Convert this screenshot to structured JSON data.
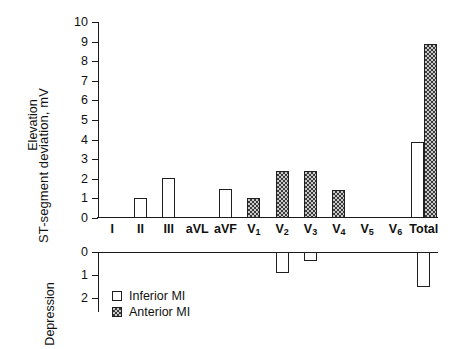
{
  "chart_data": {
    "type": "bar",
    "title": "",
    "subtitle": "",
    "ylabel": "ST-segment deviation, mV",
    "xlabel": "",
    "grid": false,
    "legend_position": "bottom-left",
    "categories": [
      "I",
      "II",
      "III",
      "aVL",
      "aVF",
      "V1",
      "V2",
      "V3",
      "V4",
      "V5",
      "V6",
      "Total"
    ],
    "category_labels": [
      "I",
      "II",
      "III",
      "aVL",
      "aVF",
      "V",
      "V",
      "V",
      "V",
      "V",
      "V",
      "Total"
    ],
    "category_subscripts": [
      "",
      "",
      "",
      "",
      "",
      "1",
      "2",
      "3",
      "4",
      "5",
      "6",
      ""
    ],
    "panels": [
      {
        "name": "elevation",
        "label": "Elevation",
        "ylim": [
          0,
          10
        ],
        "yticks": [
          0,
          1,
          2,
          3,
          4,
          5,
          6,
          7,
          8,
          9,
          10
        ],
        "ytick_labels": [
          "0",
          "1",
          "2",
          "3",
          "4",
          "5",
          "6",
          "7",
          "8",
          "9",
          "10"
        ],
        "series": [
          {
            "name": "Inferior MI",
            "fill": "white",
            "values": [
              0,
              1.0,
              2.05,
              0,
              1.5,
              0,
              0,
              0,
              0,
              0,
              0,
              3.9
            ]
          },
          {
            "name": "Anterior MI",
            "fill": "hatched",
            "values": [
              0,
              0,
              0,
              0,
              0,
              1.0,
              2.4,
              2.4,
              1.45,
              0,
              0,
              8.9
            ]
          }
        ]
      },
      {
        "name": "depression",
        "label": "Depression",
        "ylim": [
          0,
          2.6
        ],
        "yticks": [
          0,
          1,
          2
        ],
        "ytick_labels": [
          "0",
          "1",
          "2"
        ],
        "series": [
          {
            "name": "Inferior MI",
            "fill": "white",
            "values": [
              0,
              0,
              0,
              0,
              0,
              0,
              0.9,
              0.4,
              0,
              0,
              0,
              1.5
            ]
          },
          {
            "name": "Anterior MI",
            "fill": "hatched",
            "values": [
              0,
              0,
              0,
              0,
              0,
              0,
              0,
              0,
              0,
              0,
              0,
              0
            ]
          }
        ]
      }
    ],
    "legend": [
      {
        "label": "Inferior MI",
        "fill": "white"
      },
      {
        "label": "Anterior MI",
        "fill": "hatched"
      }
    ],
    "colors": {
      "axis": "#1a1a1a",
      "bar_outline": "#1f1f1f",
      "inferior_fill": "#ffffff",
      "anterior_fill": "#c9c9c9",
      "anterior_hatch": "#3a3a3a",
      "background": "#ffffff",
      "text": "#111111"
    }
  }
}
